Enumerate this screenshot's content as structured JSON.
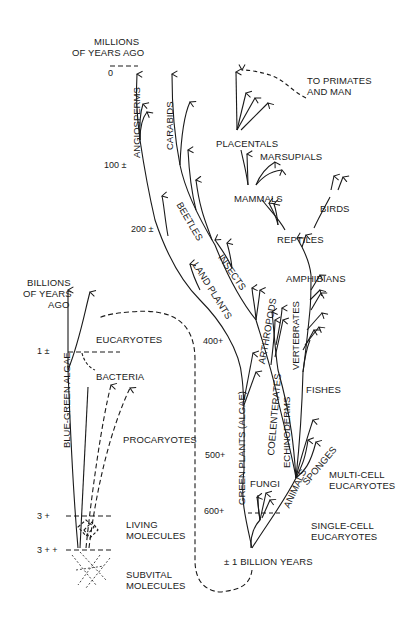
{
  "diagram": {
    "axis_millions": {
      "label_line1": "MILLIONS",
      "label_line2": "OF YEARS AGO",
      "ticks": [
        "0",
        "100 ±",
        "200 ±",
        "400+",
        "500+",
        "600+"
      ]
    },
    "axis_billions": {
      "label_line1": "BILLIONS",
      "label_line2": "OF YEARS",
      "label_line3": "AGO",
      "ticks": [
        "1 ±",
        "3 +",
        "3 + +"
      ]
    },
    "origin_label": "± 1 BILLION YEARS",
    "groups": {
      "angiosperms": "ANGIOSPERMS",
      "carabids": "CARABIDS",
      "beetles": "BEETLES",
      "insects": "INSECTS",
      "land_plants": "LAND PLANTS",
      "arthropods": "ARTHROPODS",
      "green_plants": "GREEN PLANTS (ALGAE)",
      "coelenterates": "COELENTERATES",
      "echinoderms": "ECHINODERMS",
      "vertebrates": "VERTEBRATES",
      "animals": "ANIMALS",
      "sponges": "SPONGES",
      "fungi": "FUNGI",
      "fishes": "FISHES",
      "amphibians": "AMPHIBIANS",
      "reptiles": "REPTILES",
      "birds": "BIRDS",
      "mammals": "MAMMALS",
      "marsupials": "MARSUPIALS",
      "placentals": "PLACENTALS",
      "primates_line1": "TO PRIMATES",
      "primates_line2": "AND MAN",
      "multi_cell_line1": "MULTI-CELL",
      "multi_cell_line2": "EUCARYOTES",
      "single_cell_line1": "SINGLE-CELL",
      "single_cell_line2": "EUCARYOTES",
      "eucaryotes": "EUCARYOTES",
      "bacteria": "BACTERIA",
      "blue_green_algae": "BLUE-GREEN ALGAE",
      "procaryotes": "PROCARYOTES",
      "living_line1": "LIVING",
      "living_line2": "MOLECULES",
      "subvital_line1": "SUBVITAL",
      "subvital_line2": "MOLECULES"
    },
    "line_color": "#1a1a1a"
  }
}
